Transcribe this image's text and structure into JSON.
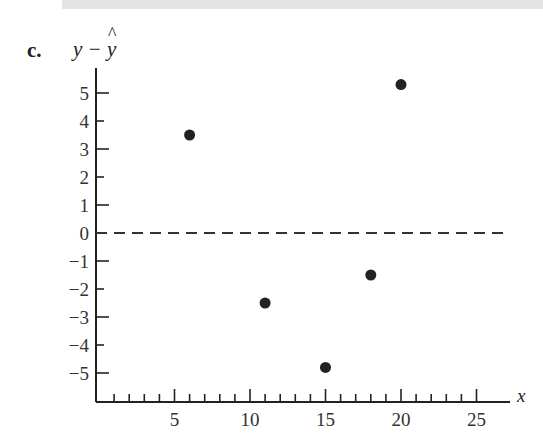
{
  "figure": {
    "part_label": "c.",
    "y_axis_label": "y − ŷ",
    "y_axis_label_base": "y − ",
    "y_axis_label_hat_var": "y",
    "x_axis_label": "x"
  },
  "colors": {
    "points": "#222222",
    "axes": "#222222",
    "reference_line": "#333333",
    "top_bar": "#e4e4e4"
  },
  "chart_data": {
    "type": "scatter",
    "title": "",
    "xlabel": "x",
    "ylabel": "y − ŷ",
    "xlim": [
      0,
      27
    ],
    "ylim": [
      -6,
      6
    ],
    "x_ticks": [
      5,
      10,
      15,
      20,
      25
    ],
    "x_minor_tick_step": 1,
    "y_ticks": [
      5,
      4,
      3,
      2,
      1,
      0,
      -1,
      -2,
      -3,
      -4,
      -5
    ],
    "grid": false,
    "legend": null,
    "reference_line": {
      "y": 0,
      "style": "dashed"
    },
    "series": [
      {
        "name": "residuals",
        "points": [
          {
            "x": 6,
            "y": 3.5
          },
          {
            "x": 11,
            "y": -2.5
          },
          {
            "x": 15,
            "y": -4.8
          },
          {
            "x": 18,
            "y": -1.5
          },
          {
            "x": 20,
            "y": 5.3
          }
        ]
      }
    ]
  }
}
